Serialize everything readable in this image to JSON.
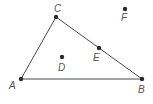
{
  "diagram": {
    "type": "geometry",
    "colors": {
      "line": "#4a4a4a",
      "point": "#2a2a2a",
      "label": "#555555",
      "background": "#ffffff"
    },
    "points": [
      {
        "id": "A",
        "label": "A",
        "x": 21,
        "y": 79,
        "lx": 9,
        "ly": 89
      },
      {
        "id": "B",
        "label": "B",
        "x": 142,
        "y": 79,
        "lx": 138,
        "ly": 93
      },
      {
        "id": "C",
        "label": "C",
        "x": 56,
        "y": 17,
        "lx": 54,
        "ly": 12
      },
      {
        "id": "D",
        "label": "D",
        "x": 62,
        "y": 57,
        "lx": 58,
        "ly": 71
      },
      {
        "id": "E",
        "label": "E",
        "x": 99,
        "y": 48,
        "lx": 93,
        "ly": 61
      },
      {
        "id": "F",
        "label": "F",
        "x": 125,
        "y": 9,
        "lx": 121,
        "ly": 21
      }
    ],
    "segments": [
      {
        "from": "A",
        "to": "B"
      },
      {
        "from": "B",
        "to": "C"
      },
      {
        "from": "C",
        "to": "A"
      }
    ],
    "relations": [
      "E lies on segment BC",
      "D lies inside triangle ABC",
      "F lies outside triangle ABC"
    ]
  }
}
